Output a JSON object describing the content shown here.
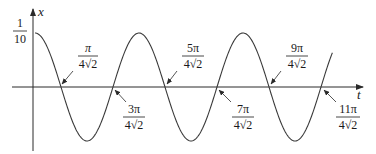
{
  "chart_data": {
    "type": "line",
    "title": "",
    "function": "x(t) = (1/10) cos(2*sqrt(2)*t)",
    "xlabel": "t",
    "ylabel": "x",
    "y_tick_label": {
      "numerator": "1",
      "denominator": "10",
      "value": 0.1
    },
    "ylim": [
      -0.1,
      0.1
    ],
    "grid": false,
    "legend": null,
    "period_label": "pi/sqrt(2)",
    "zero_crossings": [
      {
        "numerator": "π",
        "denominator": "4√2",
        "value": 0.5554,
        "label_side": "above"
      },
      {
        "numerator": "3π",
        "denominator": "4√2",
        "value": 1.6661,
        "label_side": "below"
      },
      {
        "numerator": "5π",
        "denominator": "4√2",
        "value": 2.7768,
        "label_side": "above"
      },
      {
        "numerator": "7π",
        "denominator": "4√2",
        "value": 3.8875,
        "label_side": "below"
      },
      {
        "numerator": "9π",
        "denominator": "4√2",
        "value": 4.9982,
        "label_side": "above"
      },
      {
        "numerator": "11π",
        "denominator": "4√2",
        "value": 6.1089,
        "label_side": "below"
      }
    ],
    "peaks_t": [
      0,
      2.2214,
      4.4429
    ],
    "troughs_t": [
      1.1107,
      3.3322,
      5.5536
    ],
    "x_range": [
      0,
      6.6
    ]
  },
  "axes": {
    "x_label": "t",
    "y_label": "x",
    "y_tick": {
      "numerator": "1",
      "denominator": "10"
    }
  },
  "labels": [
    {
      "id": "z1",
      "numerator": "π",
      "denominator": "4√2"
    },
    {
      "id": "z2",
      "numerator": "3π",
      "denominator": "4√2"
    },
    {
      "id": "z3",
      "numerator": "5π",
      "denominator": "4√2"
    },
    {
      "id": "z4",
      "numerator": "7π",
      "denominator": "4√2"
    },
    {
      "id": "z5",
      "numerator": "9π",
      "denominator": "4√2"
    },
    {
      "id": "z6",
      "numerator": "11π",
      "denominator": "4√2"
    }
  ],
  "style": {
    "curve_color": "#3a3a3a",
    "axis_color": "#2a2a2a",
    "text_color": "#1a1a1a"
  }
}
